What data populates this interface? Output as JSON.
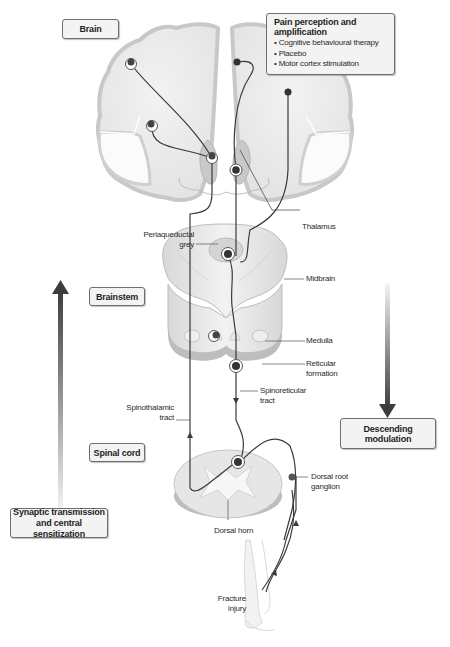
{
  "regions": {
    "brain": "Brain",
    "brainstem": "Brainstem",
    "spinal_cord": "Spinal cord"
  },
  "pain_box": {
    "title": "Pain perception and amplification",
    "items": [
      "Cognitive behavioural therapy",
      "Placebo",
      "Motor cortex stimulation"
    ]
  },
  "pathway_boxes": {
    "ascending": "Synaptic transmission and central sensitization",
    "ascending_line1": "Synaptic transmission",
    "ascending_line2": "and central sensitization",
    "descending": "Descending modulation"
  },
  "labels": {
    "thalamus": "Thalamus",
    "pag_line1": "Periaqueductal",
    "pag_line2": "grey",
    "midbrain": "Midbrain",
    "medulla": "Medulla",
    "reticular_line1": "Reticular",
    "reticular_line2": "formation",
    "spinoreticular_line1": "Spinoreticular",
    "spinoreticular_line2": "tract",
    "spinothalamic_line1": "Spinothalamic",
    "spinothalamic_line2": "tract",
    "drg_line1": "Dorsal root",
    "drg_line2": "ganglion",
    "dorsal_horn": "Dorsal horn",
    "fracture_line1": "Fracture",
    "fracture_line2": "injury"
  },
  "arrows": {
    "ascending_direction": "up",
    "descending_direction": "down"
  },
  "colors": {
    "tissue": "#dcdcdc",
    "tissue_edge": "#c4c4c4",
    "nerve": "#3a3a3a",
    "neuron": "#444444",
    "box_fill": "#f3f3f3",
    "box_border": "#6f6f6f"
  }
}
